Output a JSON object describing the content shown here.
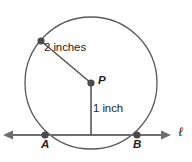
{
  "figure": {
    "type": "geometry-diagram",
    "background_color": "#ffffff",
    "stroke_color": "#58585a",
    "line_color": "#6d6e71",
    "dot_color": "#4a4a4c",
    "text_color": "#231f20",
    "circle": {
      "center_label": "P",
      "center_x": 91,
      "center_y": 83,
      "radius_px": 66
    },
    "labels": {
      "radius_measure": "2 inches",
      "distance_measure": "1 inch",
      "center_point": "P",
      "intersection_left": "A",
      "intersection_right": "B",
      "line_name": "ℓ"
    },
    "points": [
      {
        "name": "radius-endpoint",
        "x": 41,
        "y": 41
      },
      {
        "name": "center-p",
        "x": 91,
        "y": 83
      },
      {
        "name": "point-a",
        "x": 45,
        "y": 135
      },
      {
        "name": "point-b",
        "x": 137,
        "y": 135
      }
    ],
    "segments": [
      {
        "name": "radius-segment",
        "x1": 41,
        "y1": 41,
        "x2": 91,
        "y2": 83,
        "measure": "2 inches"
      },
      {
        "name": "apothem-segment",
        "x1": 91,
        "y1": 83,
        "x2": 91,
        "y2": 135,
        "measure": "1 inch"
      }
    ],
    "secant_line": {
      "name": "line-l",
      "y": 135,
      "x_start": 4,
      "x_end": 170,
      "double_arrow": true
    }
  }
}
